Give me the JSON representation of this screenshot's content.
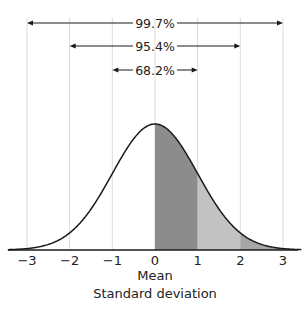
{
  "chart_data": {
    "type": "area",
    "title": "",
    "xlabel": "Standard deviation",
    "ylabel": "",
    "x_ticks": [
      "−3",
      "−2",
      "−1",
      "0",
      "1",
      "2",
      "3"
    ],
    "x_tick_values": [
      -3,
      -2,
      -1,
      0,
      1,
      2,
      3
    ],
    "mean_label": "Mean",
    "xlim": [
      -3.4,
      3.4
    ],
    "grid": true,
    "curve": "standard normal density",
    "shaded_regions": [
      {
        "from": 0,
        "to": 1,
        "color": "#8c8c8c"
      },
      {
        "from": 1,
        "to": 2,
        "color": "#c2c2c2"
      },
      {
        "from": 2,
        "to": 3,
        "color": "#a6a6a6"
      }
    ],
    "annotations": [
      {
        "label": "99.7%",
        "from": -3,
        "to": 3
      },
      {
        "label": "95.4%",
        "from": -2,
        "to": 2
      },
      {
        "label": "68.2%",
        "from": -1,
        "to": 1
      }
    ]
  }
}
